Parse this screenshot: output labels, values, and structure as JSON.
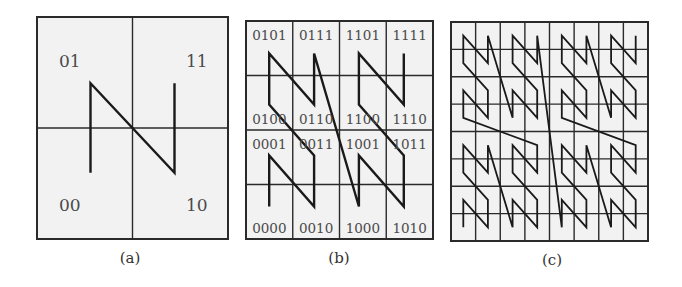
{
  "figure": {
    "background_color": "#ffffff",
    "cell_fill_color": "#f2f2f2",
    "line_color": "#1a1a1a",
    "label_color": "#4a4a4a"
  },
  "panels": [
    {
      "id": "a",
      "caption": "(a)",
      "grid_size": 2,
      "bounds": {
        "x0": 37,
        "y0": 17,
        "x1": 228,
        "y1": 239
      },
      "caption_pos": {
        "x": 130,
        "y": 263
      },
      "labels": [
        {
          "text": "01",
          "cx": 0,
          "cy": 1,
          "pos": "top"
        },
        {
          "text": "11",
          "cx": 1,
          "cy": 1,
          "pos": "top"
        },
        {
          "text": "00",
          "cx": 0,
          "cy": 0,
          "pos": "bottom"
        },
        {
          "text": "10",
          "cx": 1,
          "cy": 0,
          "pos": "bottom"
        }
      ],
      "curve_order": [
        "00",
        "01",
        "10",
        "11"
      ]
    },
    {
      "id": "b",
      "caption": "(b)",
      "grid_size": 4,
      "bounds": {
        "x0": 246,
        "y0": 21,
        "x1": 433,
        "y1": 239
      },
      "caption_pos": {
        "x": 339,
        "y": 263
      },
      "labels": [
        {
          "text": "0101",
          "cx": 0,
          "cy": 3,
          "pos": "top"
        },
        {
          "text": "0111",
          "cx": 1,
          "cy": 3,
          "pos": "top"
        },
        {
          "text": "1101",
          "cx": 2,
          "cy": 3,
          "pos": "top"
        },
        {
          "text": "1111",
          "cx": 3,
          "cy": 3,
          "pos": "top"
        },
        {
          "text": "0100",
          "cx": 0,
          "cy": 2,
          "pos": "bottom"
        },
        {
          "text": "0110",
          "cx": 1,
          "cy": 2,
          "pos": "bottom"
        },
        {
          "text": "1100",
          "cx": 2,
          "cy": 2,
          "pos": "bottom"
        },
        {
          "text": "1110",
          "cx": 3,
          "cy": 2,
          "pos": "bottom"
        },
        {
          "text": "0001",
          "cx": 0,
          "cy": 1,
          "pos": "top"
        },
        {
          "text": "0011",
          "cx": 1,
          "cy": 1,
          "pos": "top"
        },
        {
          "text": "1001",
          "cx": 2,
          "cy": 1,
          "pos": "top"
        },
        {
          "text": "1011",
          "cx": 3,
          "cy": 1,
          "pos": "top"
        },
        {
          "text": "0000",
          "cx": 0,
          "cy": 0,
          "pos": "bottom"
        },
        {
          "text": "0010",
          "cx": 1,
          "cy": 0,
          "pos": "bottom"
        },
        {
          "text": "1000",
          "cx": 2,
          "cy": 0,
          "pos": "bottom"
        },
        {
          "text": "1010",
          "cx": 3,
          "cy": 0,
          "pos": "bottom"
        }
      ]
    },
    {
      "id": "c",
      "caption": "(c)",
      "grid_size": 8,
      "bounds": {
        "x0": 451,
        "y0": 22,
        "x1": 648,
        "y1": 241
      },
      "caption_pos": {
        "x": 552,
        "y": 265
      },
      "labels": []
    }
  ]
}
